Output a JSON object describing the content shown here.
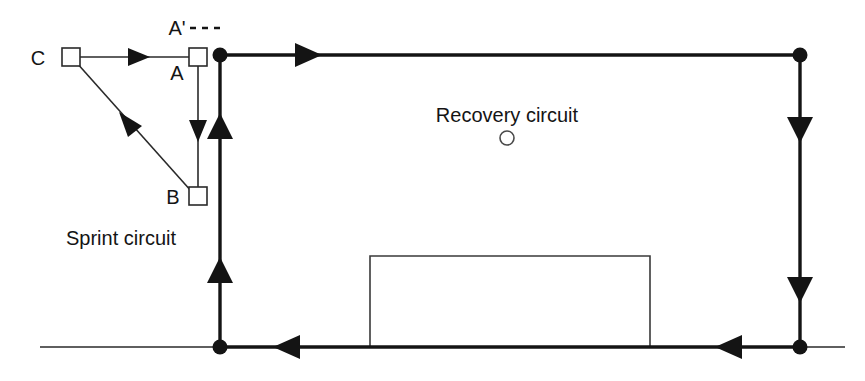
{
  "diagram": {
    "title_visible": false,
    "labels": {
      "sprint_circuit": "Sprint circuit",
      "recovery_circuit": "Recovery circuit",
      "node_c": "C",
      "node_a": "A",
      "node_a_prime": "A'",
      "node_b": "B"
    },
    "colors": {
      "line": "#141414",
      "thin_line": "#3a3a3a",
      "background": "#ffffff"
    },
    "sprint_circuit": {
      "name": "Sprint circuit",
      "style": "thin",
      "stations": [
        {
          "id": "C",
          "label": "C",
          "shape": "square",
          "x": 71,
          "y": 57,
          "size": 18
        },
        {
          "id": "A",
          "label": "A",
          "shape": "square",
          "x": 198,
          "y": 57,
          "size": 18
        },
        {
          "id": "B",
          "label": "B",
          "shape": "square",
          "x": 198,
          "y": 196,
          "size": 18
        }
      ],
      "dashed_marker": {
        "label": "A'",
        "x": 172,
        "y": 33,
        "dashes": 3
      },
      "segments": [
        {
          "from": "C",
          "to": "A",
          "direction": "right",
          "arrow_at": 0.55
        },
        {
          "from": "A",
          "to": "B",
          "direction": "down",
          "arrow_at": 0.55
        },
        {
          "from": "B",
          "to": "C",
          "direction": "diagonal-up-left",
          "arrow_at": 0.55
        }
      ]
    },
    "recovery_circuit": {
      "name": "Recovery circuit",
      "style": "thick",
      "marker_circle": {
        "cx": 507,
        "cy": 138,
        "r": 7
      },
      "nodes": [
        {
          "id": "top-left",
          "x": 220,
          "y": 55
        },
        {
          "id": "top-right",
          "x": 800,
          "y": 55
        },
        {
          "id": "bottom-right",
          "x": 800,
          "y": 347
        },
        {
          "id": "bottom-left",
          "x": 220,
          "y": 347
        }
      ],
      "segments": [
        {
          "from": "top-left",
          "to": "top-right",
          "direction": "right",
          "arrows": [
            305
          ]
        },
        {
          "from": "top-right",
          "to": "bottom-right",
          "direction": "down",
          "arrows": [
            125,
            285
          ]
        },
        {
          "from": "bottom-right",
          "to": "bottom-left",
          "direction": "left",
          "arrows": [
            737,
            295
          ]
        },
        {
          "from": "bottom-left",
          "to": "top-left",
          "direction": "up",
          "arrows": [
            283,
            130
          ]
        }
      ]
    },
    "ground_line": {
      "x1": 40,
      "x2": 845,
      "y": 347
    },
    "building": {
      "x": 370,
      "y": 256,
      "width": 280,
      "height": 91,
      "open_bottom": true
    }
  }
}
